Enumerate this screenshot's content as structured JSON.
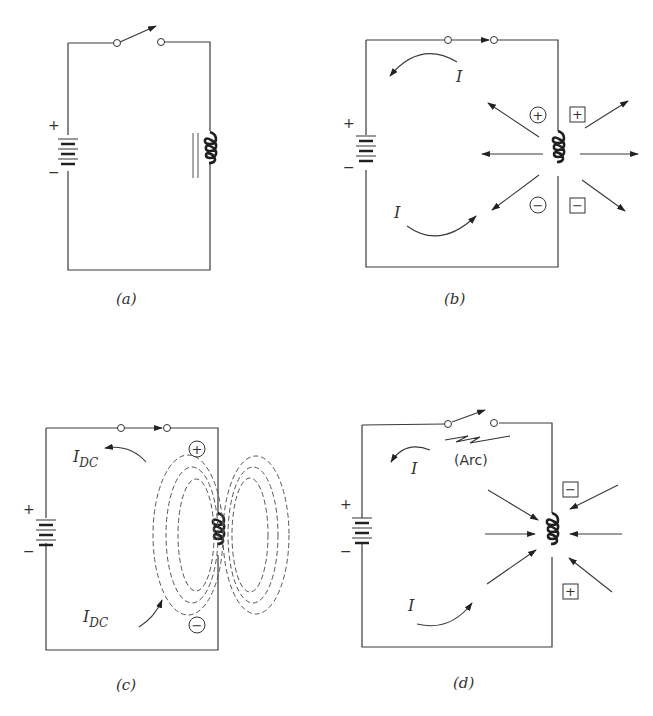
{
  "figure": {
    "panels": [
      {
        "id": "a",
        "caption": "(a)",
        "state": "switch open, no current"
      },
      {
        "id": "b",
        "caption": "(b)",
        "state": "switch closed, field expanding",
        "current_label": "I",
        "field_signs": {
          "circle_top": "+",
          "circle_bottom": "−",
          "box_top": "+",
          "box_bottom": "−"
        }
      },
      {
        "id": "c",
        "caption": "(c)",
        "state": "steady DC, field established",
        "current_label": "I",
        "current_subscript": "DC",
        "field_signs": {
          "circle_top": "+",
          "circle_bottom": "−"
        }
      },
      {
        "id": "d",
        "caption": "(d)",
        "state": "switch opened, field collapsing",
        "current_label": "I",
        "arc_label": "(Arc)",
        "field_signs": {
          "box_top": "−",
          "box_bottom": "+"
        }
      }
    ],
    "battery_plus": "+",
    "battery_minus": "−"
  }
}
